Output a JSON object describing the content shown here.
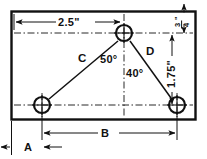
{
  "drawing": {
    "title": "Triangular hole layout on rectangular plate",
    "type": "engineering-dimension-drawing",
    "ink_color": "#111111",
    "background_color": "#ffffff",
    "plate": {
      "shape": "rectangle",
      "label": "plate-outline"
    },
    "holes": [
      {
        "id": "top-hole",
        "name": "hole-top",
        "cx": 124,
        "cy": 33,
        "r": 8
      },
      {
        "id": "bottom-left-hole",
        "name": "hole-bottom-left",
        "cx": 42,
        "cy": 105,
        "r": 8
      },
      {
        "id": "bottom-right-hole",
        "name": "hole-bottom-right",
        "cx": 177,
        "cy": 105,
        "r": 8
      }
    ],
    "dimensions": [
      {
        "id": "top-horizontal",
        "label": "2.5\"",
        "orientation": "horizontal",
        "known": true
      },
      {
        "id": "top-right-vertical",
        "label": "3/4\"",
        "numerator": "3",
        "denominator": "4",
        "unit": "\"",
        "orientation": "vertical",
        "known": true
      },
      {
        "id": "right-vertical",
        "label": "1.75\"",
        "orientation": "vertical-rotated",
        "known": true
      },
      {
        "id": "bottom-left-edge",
        "label": "A",
        "orientation": "horizontal",
        "known": false
      },
      {
        "id": "bottom-span",
        "label": "B",
        "orientation": "horizontal",
        "known": false
      },
      {
        "id": "left-leg",
        "label": "C",
        "orientation": "diagonal",
        "known": false
      },
      {
        "id": "right-leg",
        "label": "D",
        "orientation": "diagonal",
        "known": false
      }
    ],
    "angles": [
      {
        "id": "apex-left-angle",
        "label": "50°",
        "value": 50,
        "vertex": "top-hole"
      },
      {
        "id": "apex-right-angle",
        "label": "40°",
        "value": 40,
        "vertex": "top-hole"
      }
    ],
    "labels": {
      "dim_2_5": "2.5\"",
      "frac_numerator": "3",
      "frac_denominator": "4",
      "frac_unit": "\"",
      "dim_1_75": "1.75\"",
      "angle_50": "50°",
      "angle_40": "40°",
      "leg_c": "C",
      "leg_d": "D",
      "dim_a": "A",
      "dim_b": "B"
    }
  }
}
